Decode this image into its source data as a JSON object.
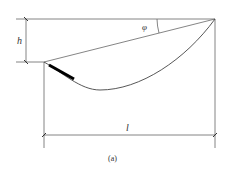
{
  "figure": {
    "caption": "(a)",
    "labels": {
      "height": "h",
      "angle": "φ",
      "length": "l"
    },
    "colors": {
      "line": "#555555",
      "thick_segment": "#000000",
      "text": "#333333",
      "background": "#ffffff"
    }
  }
}
